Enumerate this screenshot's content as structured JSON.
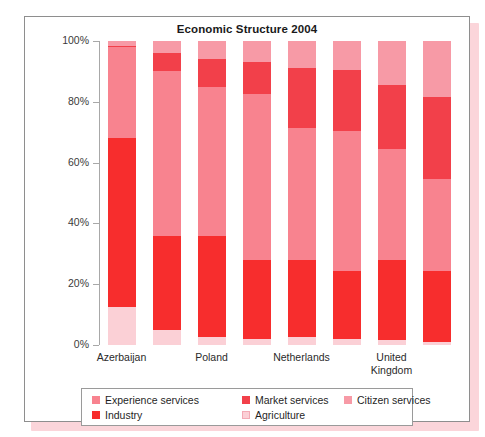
{
  "panel": {
    "title": "Economic Structure 2004"
  },
  "chart_data": {
    "type": "bar",
    "subtype": "stacked-bar-100-percent",
    "title": "Economic Structure 2004",
    "xlabel": "",
    "ylabel": "",
    "ylim": [
      0,
      100
    ],
    "yticks": [
      0,
      20,
      40,
      60,
      80,
      100
    ],
    "ytick_labels": [
      "0%",
      "20%",
      "40%",
      "60%",
      "80%",
      "100%"
    ],
    "grid": false,
    "legend_position": "bottom",
    "stack_order_bottom_to_top": [
      "Agriculture",
      "Industry",
      "Experience services",
      "Market services",
      "Citizen services"
    ],
    "categories": [
      "Azerbaijan",
      "",
      "Poland",
      "",
      "Netherlands",
      "",
      "United Kingdom",
      ""
    ],
    "visible_tick_labels": [
      "Azerbaijan",
      "Poland",
      "Netherlands",
      "United\nKingdom"
    ],
    "series": [
      {
        "name": "Agriculture",
        "color": "#fbd0d6",
        "values": [
          12.5,
          5.0,
          2.5,
          2.0,
          2.5,
          2.0,
          1.5,
          1.0
        ]
      },
      {
        "name": "Industry",
        "color": "#f72d2d",
        "values": [
          55.5,
          31.0,
          33.5,
          26.0,
          25.5,
          22.5,
          26.5,
          23.5
        ]
      },
      {
        "name": "Experience services",
        "color": "#f8838f",
        "values": [
          30.0,
          54.0,
          49.0,
          54.5,
          43.5,
          46.0,
          36.5,
          30.0
        ]
      },
      {
        "name": "Market services",
        "color": "#f2404a",
        "values": [
          0.5,
          6.0,
          9.0,
          10.5,
          19.5,
          20.0,
          21.0,
          27.0
        ]
      },
      {
        "name": "Citizen services",
        "color": "#f79aa6",
        "values": [
          1.5,
          4.0,
          6.0,
          7.0,
          9.0,
          9.5,
          14.5,
          18.5
        ]
      }
    ]
  },
  "legend": {
    "items": [
      {
        "label": "Experience services",
        "color": "#f8838f"
      },
      {
        "label": "Market services",
        "color": "#f2404a"
      },
      {
        "label": "Citizen services",
        "color": "#f79aa6"
      },
      {
        "label": "Industry",
        "color": "#f72d2d"
      },
      {
        "label": "Agriculture",
        "color": "#fbd0d6"
      }
    ]
  }
}
